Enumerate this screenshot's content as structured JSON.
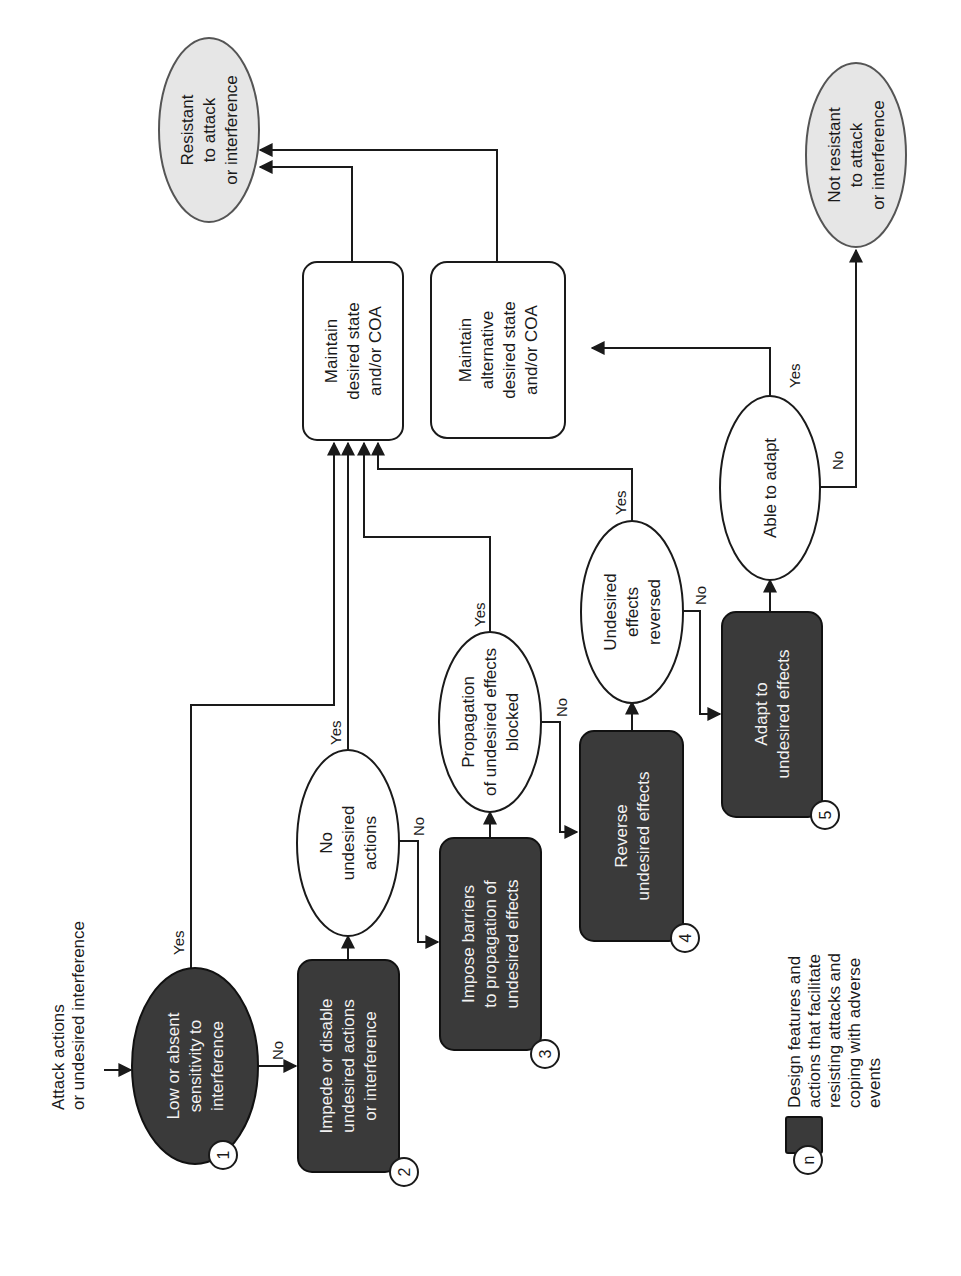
{
  "diagram": {
    "orientation": "rotated-90-ccw",
    "start": {
      "label_lines": [
        "Attack actions",
        "or undesired interference"
      ]
    },
    "nodes": {
      "n1": {
        "type": "design-feature-ellipse",
        "number": "1",
        "label_lines": [
          "Low or absent",
          "sensitivity to",
          "interference"
        ]
      },
      "n2": {
        "type": "design-feature-box",
        "number": "2",
        "label_lines": [
          "Impede or disable",
          "undesired actions",
          "or interference"
        ]
      },
      "d1": {
        "type": "decision",
        "label_lines": [
          "No",
          "undesired",
          "actions"
        ]
      },
      "n3": {
        "type": "design-feature-box",
        "number": "3",
        "label_lines": [
          "Impose barriers",
          "to propagation of",
          "undesired effects"
        ]
      },
      "d2": {
        "type": "decision",
        "label_lines": [
          "Propagation",
          "of undesired effects",
          "blocked"
        ]
      },
      "n4": {
        "type": "design-feature-box",
        "number": "4",
        "label_lines": [
          "Reverse",
          "undesired effects"
        ]
      },
      "d3": {
        "type": "decision",
        "label_lines": [
          "Undesired",
          "effects",
          "reversed"
        ]
      },
      "n5": {
        "type": "design-feature-box",
        "number": "5",
        "label_lines": [
          "Adapt to",
          "undesired effects"
        ]
      },
      "d4": {
        "type": "decision",
        "label_lines": [
          "Able to adapt"
        ]
      },
      "m1": {
        "type": "outcome-box",
        "label_lines": [
          "Maintain",
          "desired state",
          "and/or COA"
        ]
      },
      "m2": {
        "type": "outcome-box",
        "label_lines": [
          "Maintain",
          "alternative",
          "desired state",
          "and/or COA"
        ]
      },
      "t1": {
        "type": "terminal",
        "label_lines": [
          "Resistant",
          "to attack",
          "or interference"
        ]
      },
      "t2": {
        "type": "terminal",
        "label_lines": [
          "Not resistant",
          "to attack",
          "or interference"
        ]
      }
    },
    "edges": [
      {
        "from": "start",
        "to": "n1",
        "label": ""
      },
      {
        "from": "n1",
        "to": "m1",
        "label": "Yes"
      },
      {
        "from": "n1",
        "to": "n2",
        "label": "No"
      },
      {
        "from": "n2",
        "to": "d1",
        "label": ""
      },
      {
        "from": "d1",
        "to": "m1",
        "label": "Yes"
      },
      {
        "from": "d1",
        "to": "n3",
        "label": "No"
      },
      {
        "from": "n3",
        "to": "d2",
        "label": ""
      },
      {
        "from": "d2",
        "to": "m1",
        "label": "Yes"
      },
      {
        "from": "d2",
        "to": "n4",
        "label": "No"
      },
      {
        "from": "n4",
        "to": "d3",
        "label": ""
      },
      {
        "from": "d3",
        "to": "m1",
        "label": "Yes"
      },
      {
        "from": "d3",
        "to": "n5",
        "label": "No"
      },
      {
        "from": "n5",
        "to": "d4",
        "label": ""
      },
      {
        "from": "d4",
        "to": "m2",
        "label": "Yes"
      },
      {
        "from": "d4",
        "to": "t2",
        "label": "No"
      },
      {
        "from": "m1",
        "to": "t1",
        "label": ""
      },
      {
        "from": "m2",
        "to": "t1",
        "label": ""
      }
    ],
    "edge_labels": {
      "yes": "Yes",
      "no": "No"
    },
    "legend": {
      "symbol_number": "n",
      "text_lines": [
        "Design features and",
        "actions that facilitate",
        "resisting attacks and",
        "coping with adverse",
        "events"
      ]
    },
    "colors": {
      "dark_fill": "#3a3a3a",
      "terminal_fill": "#e6e6e6",
      "line": "#1a1a1a",
      "background": "#ffffff"
    }
  }
}
